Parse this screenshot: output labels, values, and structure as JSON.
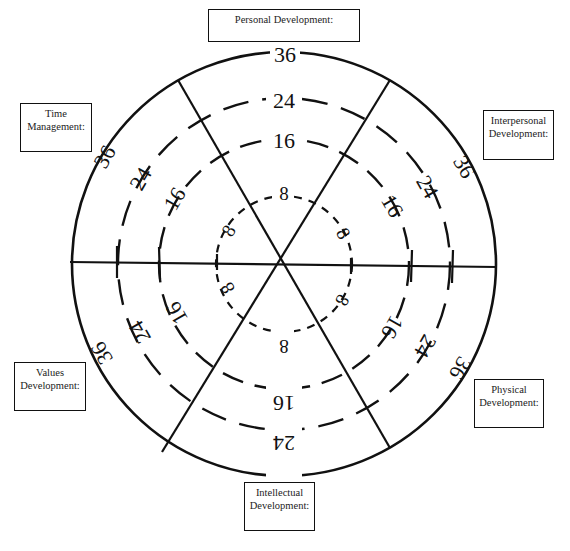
{
  "diagram": {
    "type": "wheel",
    "center": [
      284,
      264
    ],
    "spokes_deg": [
      0,
      60,
      120
    ],
    "rings": [
      {
        "value": "8",
        "radius": 68,
        "style": "dashed-fine"
      },
      {
        "value": "16",
        "radius": 125,
        "style": "dashed"
      },
      {
        "value": "24",
        "radius": 166,
        "style": "dashed"
      },
      {
        "value": "36",
        "radius": 212,
        "style": "solid"
      }
    ],
    "segments": [
      {
        "id": "personal",
        "label_lines": [
          "Personal Development:"
        ]
      },
      {
        "id": "interpersonal",
        "label_lines": [
          "Interpersonal",
          "Development:"
        ]
      },
      {
        "id": "physical",
        "label_lines": [
          "Physical",
          "Development:"
        ]
      },
      {
        "id": "intellectual",
        "label_lines": [
          "Intellectual",
          "Development:"
        ]
      },
      {
        "id": "values",
        "label_lines": [
          "Values",
          "Development:"
        ]
      },
      {
        "id": "time",
        "label_lines": [
          "Time",
          "Management:"
        ]
      }
    ]
  },
  "labels": {
    "personal": "Personal Development:",
    "interpersonal_1": "Interpersonal",
    "interpersonal_2": "Development:",
    "physical_1": "Physical",
    "physical_2": "Development:",
    "intellectual_1": "Intellectual",
    "intellectual_2": "Development:",
    "values_1": "Values",
    "values_2": "Development:",
    "time_1": "Time",
    "time_2": "Management:"
  },
  "scale": {
    "r8": "8",
    "r16": "16",
    "r24": "24",
    "r36": "36"
  }
}
